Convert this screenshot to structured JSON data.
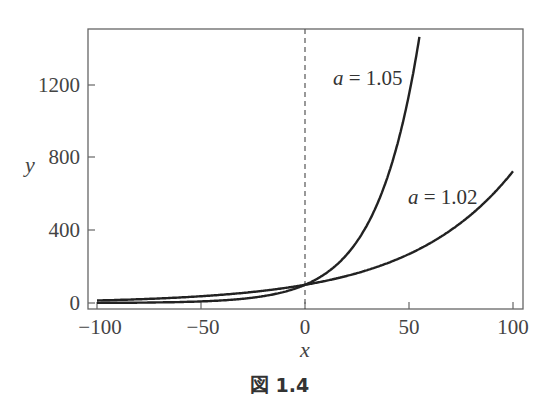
{
  "chart_data": {
    "type": "line",
    "title": "",
    "caption": "図 1.4",
    "xlabel": "x",
    "ylabel": "y",
    "xlim": [
      -104,
      104
    ],
    "ylim": [
      -30,
      1510
    ],
    "xticks": [
      -100,
      -50,
      0,
      50,
      100
    ],
    "xtick_labels": [
      "−100",
      "−50",
      "0",
      "50",
      "100"
    ],
    "yticks": [
      0,
      400,
      800,
      1200
    ],
    "ytick_labels": [
      "0",
      "400",
      "800",
      "1200"
    ],
    "grid": false,
    "legend": null,
    "reference_line": {
      "type": "vertical",
      "x": 0,
      "style": "dashed"
    },
    "formula": "y = 100 * a^x",
    "series": [
      {
        "name": "a = 1.05",
        "a": 1.05,
        "x_range": [
          -100,
          55
        ],
        "x": [
          -100,
          -75,
          -50,
          -25,
          0,
          10,
          20,
          30,
          40,
          50,
          55
        ],
        "values": [
          0.76,
          2.6,
          8.7,
          29.5,
          100,
          162.9,
          265.3,
          432.2,
          704.0,
          1146.7,
          1463.5
        ]
      },
      {
        "name": "a = 1.02",
        "a": 1.02,
        "x_range": [
          -100,
          100
        ],
        "x": [
          -100,
          -75,
          -50,
          -25,
          0,
          25,
          50,
          75,
          100
        ],
        "values": [
          13.8,
          22.6,
          37.2,
          61.0,
          100,
          164.1,
          269.2,
          441.6,
          724.5
        ]
      }
    ],
    "annotations": [
      {
        "text": "a = 1.05",
        "near_series": "a = 1.05",
        "position": "left of curve, upper"
      },
      {
        "text": "a = 1.02",
        "near_series": "a = 1.02",
        "position": "left of curve, right side"
      }
    ]
  },
  "labels": {
    "x_axis": "x",
    "y_axis": "y",
    "annot_105_a": "a",
    "annot_105_val": " = 1.05",
    "annot_102_a": "a",
    "annot_102_val": " = 1.02",
    "caption": "図 1.4",
    "xticks": [
      "−100",
      "−50",
      "0",
      "50",
      "100"
    ],
    "yticks": [
      "0",
      "400",
      "800",
      "1200"
    ]
  }
}
